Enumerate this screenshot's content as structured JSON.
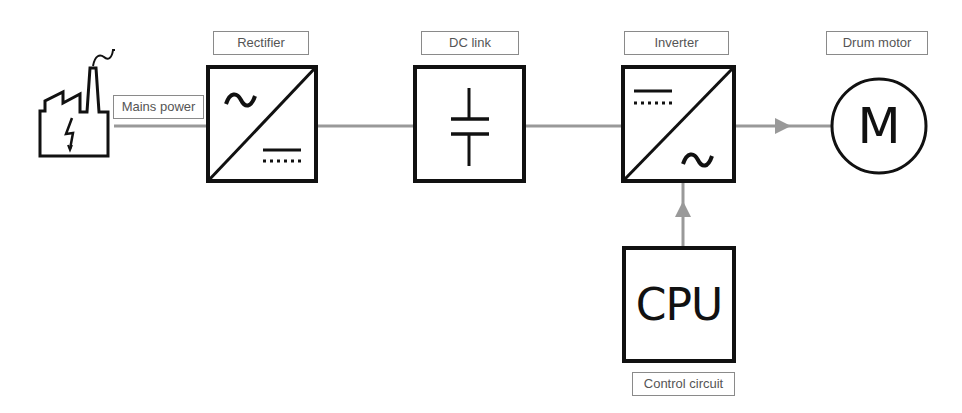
{
  "labels": {
    "mains": "Mains power",
    "rectifier": "Rectifier",
    "dc_link": "DC link",
    "inverter": "Inverter",
    "motor": "Drum motor",
    "control": "Control circuit"
  },
  "blocks": {
    "cpu_text": "CPU",
    "motor_symbol": "M",
    "rectifier_ac_symbol": "~",
    "inverter_ac_symbol": "~"
  },
  "colors": {
    "stroke": "#111111",
    "connector": "#999999",
    "label_border": "#8a8a8a",
    "label_text": "#555555"
  }
}
